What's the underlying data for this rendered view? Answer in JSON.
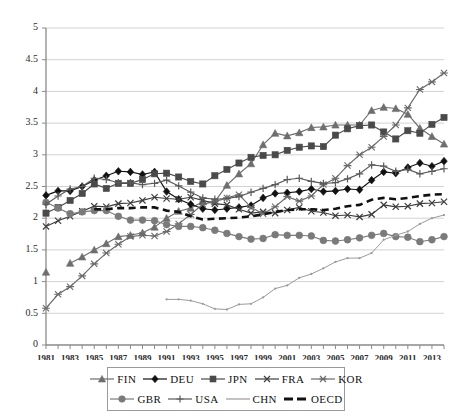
{
  "chart_data": {
    "type": "line",
    "title": "",
    "subtitle": "",
    "xlabel": "",
    "ylabel": "",
    "xlim": [
      1981,
      2014
    ],
    "ylim": [
      0,
      5
    ],
    "ytick_step": 0.5,
    "yticks": [
      "0",
      "0.5",
      "1",
      "1.5",
      "2",
      "2.5",
      "3",
      "3.5",
      "4",
      "4.5",
      "5"
    ],
    "xticks": [
      "1981",
      "1983",
      "1985",
      "1987",
      "1989",
      "1991",
      "1993",
      "1995",
      "1997",
      "1999",
      "2001",
      "2003",
      "2005",
      "2007",
      "2009",
      "2011",
      "2013"
    ],
    "x": [
      1981,
      1982,
      1983,
      1984,
      1985,
      1986,
      1987,
      1988,
      1989,
      1990,
      1991,
      1992,
      1993,
      1994,
      1995,
      1996,
      1997,
      1998,
      1999,
      2000,
      2001,
      2002,
      2003,
      2004,
      2005,
      2006,
      2007,
      2008,
      2009,
      2010,
      2011,
      2012,
      2013,
      2014
    ],
    "grid": true,
    "legend_position": "bottom",
    "series": [
      {
        "name": "FIN",
        "marker": "triangle",
        "color": "#6e6e6e",
        "values": [
          1.15,
          null,
          1.29,
          1.39,
          1.5,
          1.6,
          1.71,
          1.73,
          1.77,
          1.86,
          2.0,
          2.11,
          2.16,
          2.26,
          2.26,
          2.52,
          2.7,
          2.86,
          3.16,
          3.34,
          3.3,
          3.35,
          3.43,
          3.44,
          3.47,
          3.47,
          3.47,
          3.7,
          3.75,
          3.73,
          3.64,
          3.42,
          3.29,
          3.17
        ]
      },
      {
        "name": "DEU",
        "marker": "diamond",
        "color": "#111111",
        "values": [
          2.36,
          2.43,
          2.43,
          2.5,
          2.6,
          2.67,
          2.74,
          2.73,
          2.69,
          2.73,
          2.42,
          2.3,
          2.22,
          2.15,
          2.13,
          2.15,
          2.17,
          2.2,
          2.32,
          2.39,
          2.4,
          2.42,
          2.46,
          2.42,
          2.43,
          2.46,
          2.45,
          2.6,
          2.73,
          2.71,
          2.8,
          2.87,
          2.82,
          2.9
        ]
      },
      {
        "name": "JPN",
        "marker": "square",
        "color": "#4a4a4a",
        "values": [
          2.08,
          2.17,
          2.28,
          2.39,
          2.54,
          2.47,
          2.55,
          2.55,
          2.61,
          2.7,
          2.71,
          2.65,
          2.58,
          2.54,
          2.67,
          2.77,
          2.87,
          2.96,
          2.99,
          3.0,
          3.07,
          3.12,
          3.14,
          3.13,
          3.31,
          3.41,
          3.46,
          3.47,
          3.36,
          3.25,
          3.38,
          3.34,
          3.48,
          3.59
        ]
      },
      {
        "name": "FRA",
        "marker": "x",
        "color": "#3c3c3c",
        "values": [
          1.87,
          1.96,
          2.03,
          2.11,
          2.19,
          2.18,
          2.23,
          2.24,
          2.28,
          2.33,
          2.31,
          2.3,
          2.33,
          2.28,
          2.23,
          2.21,
          2.14,
          2.08,
          2.1,
          2.08,
          2.13,
          2.17,
          2.11,
          2.09,
          2.04,
          2.05,
          2.02,
          2.06,
          2.21,
          2.18,
          2.19,
          2.23,
          2.24,
          2.26
        ]
      },
      {
        "name": "KOR",
        "marker": "asterisk",
        "color": "#6a6a6a",
        "values": [
          0.58,
          0.8,
          0.92,
          1.09,
          1.28,
          1.45,
          1.59,
          1.71,
          1.73,
          1.72,
          1.79,
          1.91,
          2.06,
          2.22,
          2.26,
          2.32,
          2.37,
          2.17,
          2.07,
          2.18,
          2.34,
          2.27,
          2.35,
          2.53,
          2.63,
          2.83,
          3.0,
          3.12,
          3.29,
          3.47,
          3.74,
          4.03,
          4.15,
          4.29
        ]
      },
      {
        "name": "GBR",
        "marker": "circle",
        "color": "#7a7a7a",
        "values": [
          2.25,
          2.16,
          2.07,
          2.1,
          2.12,
          2.12,
          2.03,
          1.97,
          1.97,
          1.96,
          1.9,
          1.87,
          1.87,
          1.85,
          1.81,
          1.76,
          1.71,
          1.67,
          1.68,
          1.74,
          1.73,
          1.73,
          1.72,
          1.65,
          1.64,
          1.66,
          1.69,
          1.73,
          1.76,
          1.71,
          1.7,
          1.63,
          1.66,
          1.71
        ]
      },
      {
        "name": "USA",
        "marker": "plus",
        "color": "#5a5a5a",
        "values": [
          2.22,
          2.35,
          2.46,
          2.5,
          2.63,
          2.61,
          2.56,
          2.56,
          2.53,
          2.55,
          2.6,
          2.51,
          2.41,
          2.32,
          2.3,
          2.31,
          2.34,
          2.41,
          2.47,
          2.53,
          2.61,
          2.63,
          2.58,
          2.55,
          2.56,
          2.62,
          2.7,
          2.84,
          2.82,
          2.74,
          2.77,
          2.7,
          2.74,
          2.78
        ]
      },
      {
        "name": "CHN",
        "marker": "none",
        "color": "#9b9b9b",
        "values": [
          null,
          null,
          null,
          null,
          null,
          null,
          null,
          null,
          null,
          null,
          0.72,
          0.72,
          0.7,
          0.65,
          0.57,
          0.56,
          0.64,
          0.65,
          0.75,
          0.89,
          0.94,
          1.06,
          1.12,
          1.21,
          1.31,
          1.37,
          1.37,
          1.45,
          1.66,
          1.73,
          1.79,
          1.91,
          2.0,
          2.05
        ]
      },
      {
        "name": "OECD",
        "marker": "dash",
        "color": "#111111",
        "values": [
          null,
          null,
          null,
          null,
          2.14,
          2.14,
          2.16,
          2.16,
          2.17,
          2.17,
          2.12,
          2.1,
          2.03,
          1.98,
          1.99,
          2.0,
          2.01,
          2.03,
          2.06,
          2.1,
          2.13,
          2.14,
          2.14,
          2.13,
          2.15,
          2.19,
          2.21,
          2.29,
          2.32,
          2.3,
          2.32,
          2.35,
          2.37,
          2.38
        ]
      }
    ]
  },
  "legend": {
    "row1": [
      {
        "label": "FIN",
        "marker": "triangle",
        "color": "#6e6e6e"
      },
      {
        "label": "DEU",
        "marker": "diamond",
        "color": "#111111"
      },
      {
        "label": "JPN",
        "marker": "square",
        "color": "#4a4a4a"
      },
      {
        "label": "FRA",
        "marker": "x",
        "color": "#3c3c3c"
      },
      {
        "label": "KOR",
        "marker": "asterisk",
        "color": "#6a6a6a"
      }
    ],
    "row2": [
      {
        "label": "GBR",
        "marker": "circle",
        "color": "#7a7a7a"
      },
      {
        "label": "USA",
        "marker": "plus",
        "color": "#5a5a5a"
      },
      {
        "label": "CHN",
        "marker": "none",
        "color": "#9b9b9b"
      },
      {
        "label": "OECD",
        "marker": "dash",
        "color": "#111111"
      }
    ]
  }
}
